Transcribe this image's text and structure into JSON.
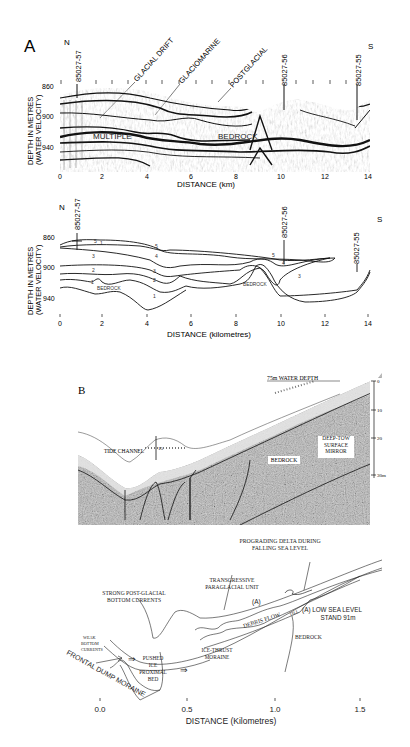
{
  "figure": {
    "panel_a": {
      "label": "A",
      "direction_left": "N",
      "direction_right": "S",
      "cores": [
        "85027-57",
        "85027-56",
        "85027-55"
      ],
      "core_positions_km": [
        0.8,
        10.0,
        13.4
      ],
      "unit_labels": [
        "GLACIAL DRIFT",
        "GLACIOMARINE",
        "POSTGLACIAL"
      ],
      "in_profile_labels": [
        "MULTIPLE",
        "BEDROCK"
      ],
      "y_axis_title_line1": "DEPTH IN METRES",
      "y_axis_title_line2": "(WATER VELOCITY)",
      "y_ticks": [
        "860",
        "900",
        "940"
      ],
      "x_ticks": [
        "0",
        "2",
        "4",
        "6",
        "8",
        "10",
        "12",
        "14"
      ],
      "x_axis_title": "DISTANCE (km)"
    },
    "panel_a_interp": {
      "direction_left": "N",
      "direction_right": "S",
      "cores": [
        "85027-57",
        "85027-56",
        "85027-55"
      ],
      "layer_numbers": [
        "1",
        "2",
        "3",
        "4",
        "5"
      ],
      "labels": [
        "BEDROCK",
        "BEDROCK"
      ],
      "y_axis_title_line1": "DEPTH IN METRES",
      "y_axis_title_line2": "(WATER VELOCITY)",
      "y_ticks": [
        "860",
        "900",
        "940"
      ],
      "x_ticks": [
        "0",
        "2",
        "4",
        "6",
        "8",
        "10",
        "12",
        "14"
      ],
      "x_axis_title": "DISTANCE (kilometres)"
    },
    "panel_b": {
      "label": "B",
      "water_depth_label": "75m WATER DEPTH",
      "labels": [
        "TIDE CHANNEL",
        "BEDROCK",
        "DEEP-TOW SURFACE MIRROR"
      ],
      "scale_ticks": [
        "0",
        "10",
        "20",
        "30m"
      ],
      "marker": "15"
    },
    "panel_b_interp": {
      "labels": {
        "prograding_delta_line1": "PROGRADING DELTA DURING",
        "prograding_delta_line2": "FALLING SEA LEVEL",
        "transgressive_line1": "TRANSGRESSIVE",
        "transgressive_line2": "PARAGLACIAL UNIT",
        "strong_currents_line1": "STRONG POST-GLACIAL",
        "strong_currents_line2": "BOTTOM CURRENTS",
        "unit_a": "(A)",
        "low_sea_level_line1": "(A) LOW SEA LEVEL",
        "low_sea_level_line2": "STAND 91m",
        "debris_flow": "DEBRIS FLOW",
        "till": "TILL",
        "bedrock": "BEDROCK",
        "weak_line1": "WEAK",
        "weak_line2": "BOTTOM",
        "weak_line3": "CURRENTS",
        "pushed_line1": "PUSHED",
        "pushed_line2": "ICE",
        "pushed_line3": "PROXIMAL",
        "pushed_line4": "BED",
        "ice_thrust_line1": "ICE-THRUST",
        "ice_thrust_line2": "MORAINE",
        "frontal_dump": "FRONTAL DUMP MORAINE"
      },
      "x_ticks": [
        "0.0",
        "0.5",
        "1.0",
        "1.5"
      ],
      "x_axis_title": "DISTANCE (Kilometres)"
    }
  }
}
